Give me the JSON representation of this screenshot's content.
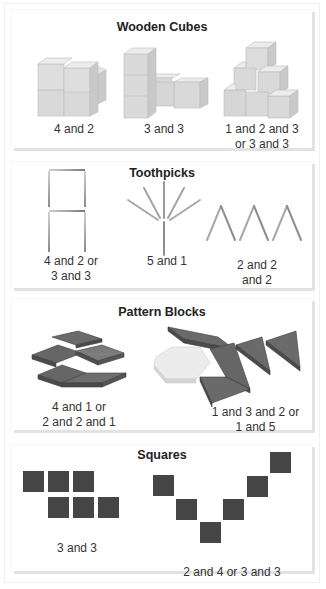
{
  "panels": [
    {
      "title": "Wooden Cubes",
      "items": [
        {
          "caption": "4 and 2"
        },
        {
          "caption": "3 and 3"
        },
        {
          "caption": "1 and 2 and 3\nor 3 and 3"
        }
      ]
    },
    {
      "title": "Toothpicks",
      "items": [
        {
          "caption": "4 and 2 or\n3 and 3"
        },
        {
          "caption": "5 and 1"
        },
        {
          "caption": "2 and 2\nand 2"
        }
      ]
    },
    {
      "title": "Pattern Blocks",
      "items": [
        {
          "caption": "4 and 1 or\n2 and 2 and 1"
        },
        {
          "caption": "1 and 3 and 2 or\n1 and 5"
        }
      ]
    },
    {
      "title": "Squares",
      "items": [
        {
          "caption": "3 and 3"
        },
        {
          "caption": "2 and 4 or 3 and 3"
        }
      ]
    }
  ],
  "colors": {
    "cube_top": "#e6e6e6",
    "cube_front": "#d9d9d9",
    "cube_side": "#c9c9c9",
    "block_top": "#6a6a6a",
    "block_edge": "#4a4a4a",
    "hexagon": "#ececec",
    "square": "#454545",
    "toothpick": "#9a9a9a",
    "shadow": "#e2e2e2"
  }
}
